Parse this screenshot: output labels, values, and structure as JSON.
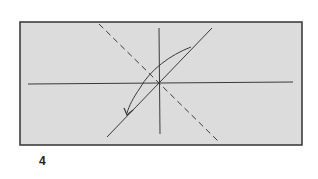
{
  "diagram": {
    "type": "origami-fold-step",
    "step_number": "4",
    "colors": {
      "paper_fill": "#dcdcdc",
      "paper_border": "#333333",
      "line": "#3a3a3a"
    },
    "paper": {
      "x": 20,
      "y": 22,
      "width": 282,
      "height": 123
    },
    "crease_lines": [
      {
        "name": "horizontal-crease",
        "x1": 28,
        "y1": 84,
        "x2": 293,
        "y2": 82,
        "style": "solid"
      },
      {
        "name": "vertical-crease",
        "x1": 159,
        "y1": 28,
        "x2": 160,
        "y2": 134,
        "style": "solid"
      },
      {
        "name": "diagonal-crease",
        "x1": 107,
        "y1": 137,
        "x2": 212,
        "y2": 28,
        "style": "solid"
      },
      {
        "name": "valley-fold-line",
        "x1": 99,
        "y1": 24,
        "x2": 219,
        "y2": 142,
        "style": "dashed"
      }
    ],
    "arrow": {
      "name": "fold-direction-arrow",
      "from": [
        191,
        47
      ],
      "to": [
        127,
        113
      ]
    }
  }
}
